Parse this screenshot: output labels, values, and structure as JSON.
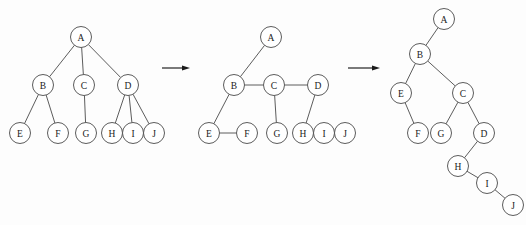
{
  "figure": {
    "type": "diagram",
    "background_color": "#fdfdfd",
    "node_stroke_color": "#4a4a4a",
    "node_fill_color": "#ffffff",
    "edge_color": "#4a4a4a",
    "arrow_color": "#1a1a1a",
    "node_radius": 10.5
  },
  "panels": [
    {
      "id": "panel-general-tree",
      "name": "general-tree",
      "caption": "",
      "nodes": [
        {
          "id": "A",
          "label": "A",
          "x": 81,
          "y": 37
        },
        {
          "id": "B",
          "label": "B",
          "x": 43,
          "y": 85
        },
        {
          "id": "C",
          "label": "C",
          "x": 84,
          "y": 85
        },
        {
          "id": "D",
          "label": "D",
          "x": 128,
          "y": 85
        },
        {
          "id": "E",
          "label": "E",
          "x": 20,
          "y": 133
        },
        {
          "id": "F",
          "label": "F",
          "x": 58,
          "y": 133
        },
        {
          "id": "G",
          "label": "G",
          "x": 86,
          "y": 133
        },
        {
          "id": "H",
          "label": "H",
          "x": 112,
          "y": 133
        },
        {
          "id": "I",
          "label": "I",
          "x": 133,
          "y": 133
        },
        {
          "id": "J",
          "label": "J",
          "x": 154,
          "y": 133
        }
      ],
      "edges": [
        {
          "from": "A",
          "to": "B"
        },
        {
          "from": "A",
          "to": "C"
        },
        {
          "from": "A",
          "to": "D"
        },
        {
          "from": "B",
          "to": "E"
        },
        {
          "from": "B",
          "to": "F"
        },
        {
          "from": "C",
          "to": "G"
        },
        {
          "from": "D",
          "to": "H"
        },
        {
          "from": "D",
          "to": "I"
        },
        {
          "from": "D",
          "to": "J"
        }
      ]
    },
    {
      "id": "panel-linked-siblings",
      "name": "left-child-right-sibling-linkage",
      "caption": "",
      "nodes": [
        {
          "id": "A",
          "label": "A",
          "x": 271,
          "y": 37
        },
        {
          "id": "B",
          "label": "B",
          "x": 234,
          "y": 85
        },
        {
          "id": "C",
          "label": "C",
          "x": 274,
          "y": 85
        },
        {
          "id": "D",
          "label": "D",
          "x": 318,
          "y": 85
        },
        {
          "id": "E",
          "label": "E",
          "x": 209,
          "y": 133
        },
        {
          "id": "F",
          "label": "F",
          "x": 247,
          "y": 133
        },
        {
          "id": "G",
          "label": "G",
          "x": 277,
          "y": 133
        },
        {
          "id": "H",
          "label": "H",
          "x": 303,
          "y": 133
        },
        {
          "id": "I",
          "label": "I",
          "x": 324,
          "y": 133
        },
        {
          "id": "J",
          "label": "J",
          "x": 345,
          "y": 133
        }
      ],
      "edges": [
        {
          "from": "A",
          "to": "B"
        },
        {
          "from": "B",
          "to": "C"
        },
        {
          "from": "C",
          "to": "D"
        },
        {
          "from": "B",
          "to": "E"
        },
        {
          "from": "E",
          "to": "F"
        },
        {
          "from": "C",
          "to": "G"
        },
        {
          "from": "D",
          "to": "H"
        },
        {
          "from": "H",
          "to": "I"
        },
        {
          "from": "I",
          "to": "J"
        }
      ]
    },
    {
      "id": "panel-binary-tree",
      "name": "binary-tree-result",
      "caption": "",
      "nodes": [
        {
          "id": "A",
          "label": "A",
          "x": 444,
          "y": 19
        },
        {
          "id": "B",
          "label": "B",
          "x": 420,
          "y": 54
        },
        {
          "id": "E",
          "label": "E",
          "x": 401,
          "y": 93
        },
        {
          "id": "C",
          "label": "C",
          "x": 463,
          "y": 93
        },
        {
          "id": "F",
          "label": "F",
          "x": 418,
          "y": 133
        },
        {
          "id": "G",
          "label": "G",
          "x": 441,
          "y": 133
        },
        {
          "id": "D",
          "label": "D",
          "x": 484,
          "y": 133
        },
        {
          "id": "H",
          "label": "H",
          "x": 458,
          "y": 166
        },
        {
          "id": "I",
          "label": "I",
          "x": 487,
          "y": 183
        },
        {
          "id": "J",
          "label": "J",
          "x": 513,
          "y": 205
        }
      ],
      "edges": [
        {
          "from": "A",
          "to": "B"
        },
        {
          "from": "B",
          "to": "E"
        },
        {
          "from": "B",
          "to": "C"
        },
        {
          "from": "E",
          "to": "F"
        },
        {
          "from": "C",
          "to": "G"
        },
        {
          "from": "C",
          "to": "D"
        },
        {
          "from": "D",
          "to": "H"
        },
        {
          "from": "H",
          "to": "I"
        },
        {
          "from": "I",
          "to": "J"
        }
      ]
    }
  ],
  "arrows": [
    {
      "id": "arrow-1",
      "name": "transform-arrow-1",
      "x1": 162,
      "y1": 68,
      "x2": 190,
      "y2": 68
    },
    {
      "id": "arrow-2",
      "name": "transform-arrow-2",
      "x1": 348,
      "y1": 68,
      "x2": 380,
      "y2": 68
    }
  ]
}
